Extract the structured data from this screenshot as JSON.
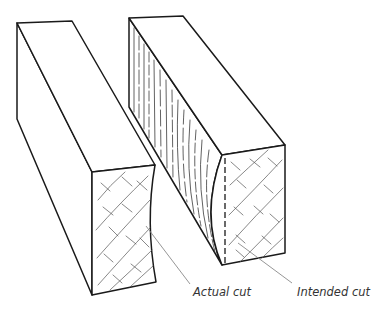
{
  "figure": {
    "blocks": [
      {
        "name": "left-block",
        "end_face": "concave actual cut surface with cross-hatched end grain"
      },
      {
        "name": "right-block",
        "end_face": "convex actual cut surface with dashed intended cut line",
        "side_face": "long grain lines"
      }
    ],
    "labels": {
      "actual_cut": "Actual cut",
      "intended_cut": "Intended cut"
    },
    "colors": {
      "line": "#1a1a1a",
      "leader": "#8a8a8a",
      "label": "#333333",
      "background": "#ffffff"
    }
  }
}
